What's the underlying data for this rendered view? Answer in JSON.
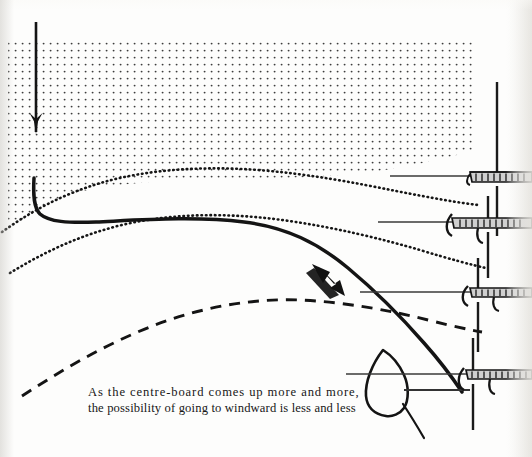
{
  "figure": {
    "caption_line_1": "As the centre-board comes up more and more,",
    "caption_line_2": "the possibility of going to windward is less and less",
    "colors": {
      "ink": "#1a1a1a",
      "paper": "#fdfdfc",
      "stipple": "#3a3a3a"
    },
    "wind": {
      "arrow_label": "wind-direction-arrow",
      "direction": "downward",
      "arrow_x": 36,
      "arrow_top_y": 22,
      "arrow_tip_y": 130
    },
    "stipple_field": {
      "name": "wind-field-stipple",
      "x": 8,
      "y": 38,
      "width": 468,
      "height": 140,
      "dot_spacing_x": 7,
      "dot_spacing_y": 7,
      "dot_radius": 0.95
    },
    "tracks": [
      {
        "name": "track-close-hauled-solid",
        "style": "solid",
        "description": "centre-board fully down, boat points highest to windward",
        "has_arrowhead": true
      },
      {
        "name": "track-dotted-upper",
        "style": "fine-dotted",
        "description": "centre-board partly raised"
      },
      {
        "name": "track-dotted-lower",
        "style": "fine-dotted",
        "description": "centre-board raised further"
      },
      {
        "name": "track-dashed-lower",
        "style": "long-dashed",
        "description": "centre-board almost fully up, much leeway"
      }
    ],
    "boats": [
      {
        "name": "boat-1",
        "mast_x": 497,
        "hull_y": 179,
        "centreboard": "fully-down"
      },
      {
        "name": "boat-2",
        "mast_x": 488,
        "hull_y": 225,
        "centreboard": "three-quarters-down"
      },
      {
        "name": "boat-3",
        "mast_x": 478,
        "hull_y": 296,
        "centreboard": "half-down"
      },
      {
        "name": "boat-4",
        "mast_x": 473,
        "hull_y": 378,
        "centreboard": "mostly-up"
      }
    ],
    "sail": {
      "name": "sail-outline",
      "description": "foreshortened sail / hull outline of leading boat"
    }
  }
}
